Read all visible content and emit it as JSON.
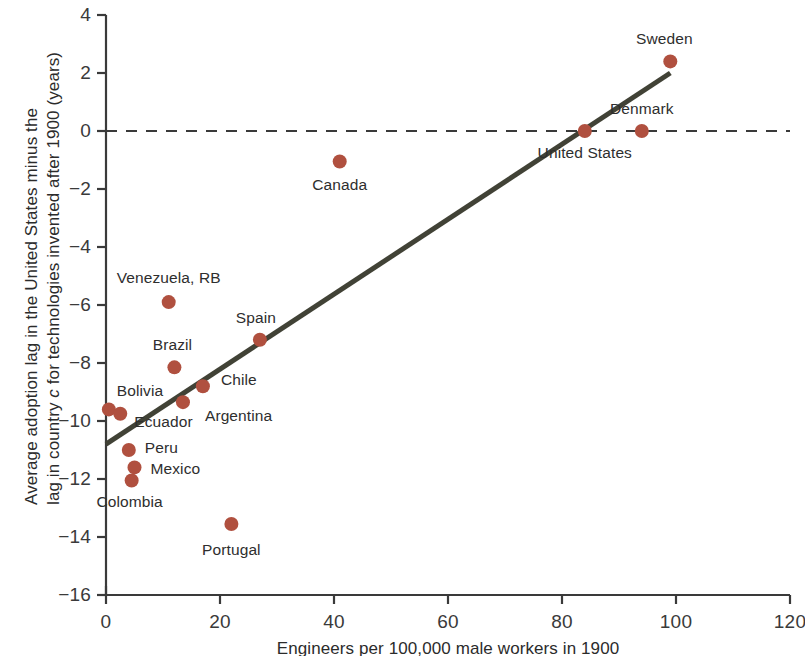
{
  "figure": {
    "background_color": "#ffffff",
    "width": 805,
    "height": 656
  },
  "chart_data": {
    "type": "scatter",
    "title": "",
    "xlabel": "Engineers per 100,000 male workers in 1900",
    "ylabel_line1": "Average adoption lag in the United States minus the",
    "ylabel_line2_pre": "lag in country ",
    "ylabel_line2_italic": "c",
    "ylabel_line2_post": " for technologies invented after 1900 (years)",
    "xlim": [
      0,
      120
    ],
    "ylim": [
      -16,
      4
    ],
    "xticks": [
      0,
      20,
      40,
      60,
      80,
      100,
      120
    ],
    "yticks": [
      4,
      2,
      0,
      -2,
      -4,
      -6,
      -8,
      -10,
      -12,
      -14,
      -16
    ],
    "xtick_labels": [
      "0",
      "20",
      "40",
      "60",
      "80",
      "100",
      "120"
    ],
    "ytick_labels": [
      "4",
      "2",
      "0",
      "−2",
      "−4",
      "−6",
      "−8",
      "−10",
      "−12",
      "−14",
      "−16"
    ],
    "grid": false,
    "legend": "none",
    "marker_color": "#b0503f",
    "marker_size": 9,
    "trendline": {
      "color": "#414236",
      "width": 5,
      "x_start": 0,
      "y_start": -10.8,
      "x_end": 99,
      "y_end": 2.0
    },
    "reference_line": {
      "y": 0,
      "style": "dashed",
      "color": "#3a3a3a",
      "width": 2
    },
    "points": [
      {
        "name": "Sweden",
        "x": 99.0,
        "y": 2.4,
        "label_dx": -6,
        "label_dy": -22,
        "label_anchor": "middle"
      },
      {
        "name": "Denmark",
        "x": 94.0,
        "y": 0.0,
        "label_dx": 0,
        "label_dy": -22,
        "label_anchor": "middle"
      },
      {
        "name": "United States",
        "x": 84.0,
        "y": 0.0,
        "label_dx": 0,
        "label_dy": 22,
        "label_anchor": "middle"
      },
      {
        "name": "Canada",
        "x": 41.0,
        "y": -1.05,
        "label_dx": 0,
        "label_dy": 24,
        "label_anchor": "middle"
      },
      {
        "name": "Venezuela, RB",
        "x": 11.0,
        "y": -5.9,
        "label_dx": 0,
        "label_dy": -24,
        "label_anchor": "middle"
      },
      {
        "name": "Spain",
        "x": 27.0,
        "y": -7.2,
        "label_dx": -4,
        "label_dy": -22,
        "label_anchor": "middle"
      },
      {
        "name": "Brazil",
        "x": 12.0,
        "y": -8.15,
        "label_dx": -2,
        "label_dy": -22,
        "label_anchor": "middle"
      },
      {
        "name": "Chile",
        "x": 17.0,
        "y": -8.8,
        "label_dx": 18,
        "label_dy": -6,
        "label_anchor": "start"
      },
      {
        "name": "Argentina",
        "x": 13.5,
        "y": -9.35,
        "label_dx": 22,
        "label_dy": 14,
        "label_anchor": "start"
      },
      {
        "name": "Bolivia",
        "x": 0.5,
        "y": -9.6,
        "label_dx": 8,
        "label_dy": -18,
        "label_anchor": "start"
      },
      {
        "name": "Ecuador",
        "x": 2.5,
        "y": -9.75,
        "label_dx": 14,
        "label_dy": 8,
        "label_anchor": "start"
      },
      {
        "name": "Peru",
        "x": 4.0,
        "y": -11.0,
        "label_dx": 16,
        "label_dy": -2,
        "label_anchor": "start"
      },
      {
        "name": "Mexico",
        "x": 5.0,
        "y": -11.6,
        "label_dx": 16,
        "label_dy": 2,
        "label_anchor": "start"
      },
      {
        "name": "Colombia",
        "x": 4.5,
        "y": -12.05,
        "label_dx": -2,
        "label_dy": 22,
        "label_anchor": "middle"
      },
      {
        "name": "Portugal",
        "x": 22.0,
        "y": -13.55,
        "label_dx": 0,
        "label_dy": 26,
        "label_anchor": "middle"
      }
    ]
  }
}
